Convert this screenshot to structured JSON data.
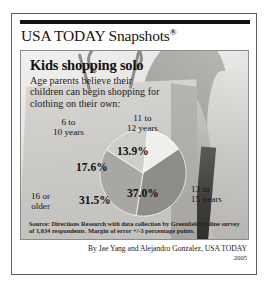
{
  "brand": {
    "title": "USA TODAY Snapshots",
    "registered_mark": "®"
  },
  "headline": "Kids shopping solo",
  "subhead": "Age parents believe their children can begin shopping for clothing on their own:",
  "source_note": "Source: Directions Research with data collection by Greenfield Online survey of 1,034 respondents. Margin of error +/-3 percentage points.",
  "byline": {
    "credit": "By Jae Yang and Alejandro Gonzalez, USA TODAY",
    "year": "2005"
  },
  "chart_data": {
    "type": "pie",
    "title": "Kids shopping solo",
    "subtitle": "Age parents believe their children can begin shopping for clothing on their own:",
    "categories": [
      "11 to 12 years",
      "13 to 15 years",
      "16 or older",
      "6 to 10 years"
    ],
    "values": [
      13.9,
      37.0,
      31.5,
      17.6
    ],
    "labels": [
      "13.9%",
      "37.0%",
      "31.5%",
      "17.6%"
    ],
    "colors": [
      "#f0efed",
      "#8e8d89",
      "#a8a7a3",
      "#cfcecb"
    ],
    "legend": "callout-labels",
    "grid": false,
    "units": "percent"
  },
  "slices": [
    {
      "label": "11 to 12 years",
      "pct_text": "13.9%",
      "value": 13.9,
      "color": "#f0efed"
    },
    {
      "label": "13 to 15 years",
      "pct_text": "37.0%",
      "value": 37.0,
      "color": "#8e8d89"
    },
    {
      "label": "16 or older",
      "pct_text": "31.5%",
      "value": 31.5,
      "color": "#a8a7a3"
    },
    {
      "label": "6 to 10 years",
      "pct_text": "17.6%",
      "value": 17.6,
      "color": "#cfcecb"
    }
  ]
}
